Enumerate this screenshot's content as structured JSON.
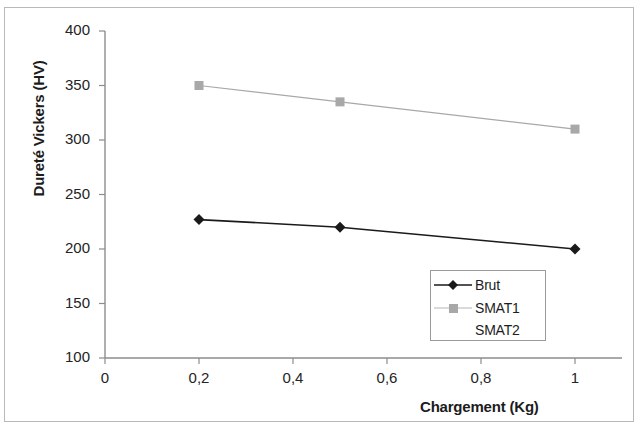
{
  "chart_data": {
    "type": "line",
    "title": "",
    "xlabel": "Chargement (Kg)",
    "ylabel": "Dureté Vickers (HV)",
    "xlim": [
      0,
      1.1
    ],
    "ylim": [
      100,
      400
    ],
    "xticks": [
      "0",
      "0,2",
      "0,4",
      "0,6",
      "0,8",
      "1"
    ],
    "xtick_values": [
      0,
      0.2,
      0.4,
      0.6,
      0.8,
      1
    ],
    "yticks": [
      "100",
      "150",
      "200",
      "250",
      "300",
      "350",
      "400"
    ],
    "ytick_values": [
      100,
      150,
      200,
      250,
      300,
      350,
      400
    ],
    "grid": false,
    "legend_position": "inside-lower-right",
    "series": [
      {
        "name": "Brut",
        "color": "#1a1a1a",
        "marker": "diamond",
        "x": [
          0.2,
          0.5,
          1.0
        ],
        "values": [
          227,
          220,
          200
        ]
      },
      {
        "name": "SMAT1",
        "color": "#a8a8a8",
        "marker": "square",
        "x": [
          0.2,
          0.5,
          1.0
        ],
        "values": [
          350,
          335,
          310
        ]
      },
      {
        "name": "SMAT2",
        "color": "#ffffff",
        "marker": "none",
        "x": [],
        "values": []
      }
    ]
  },
  "legend": {
    "items": [
      {
        "label": "Brut"
      },
      {
        "label": "SMAT1"
      },
      {
        "label": "SMAT2"
      }
    ]
  },
  "axes": {
    "y_label": "Dureté Vickers (HV)",
    "x_label": "Chargement (Kg)",
    "y_ticks": [
      {
        "label": "400"
      },
      {
        "label": "350"
      },
      {
        "label": "300"
      },
      {
        "label": "250"
      },
      {
        "label": "200"
      },
      {
        "label": "150"
      },
      {
        "label": "100"
      }
    ],
    "x_ticks": [
      {
        "label": "0"
      },
      {
        "label": "0,2"
      },
      {
        "label": "0,4"
      },
      {
        "label": "0,6"
      },
      {
        "label": "0,8"
      },
      {
        "label": "1"
      }
    ]
  },
  "colors": {
    "series_brut": "#1a1a1a",
    "series_smat1": "#a8a8a8",
    "axis": "#8d8d8d",
    "text": "#1c1c1c",
    "background": "#ffffff"
  }
}
